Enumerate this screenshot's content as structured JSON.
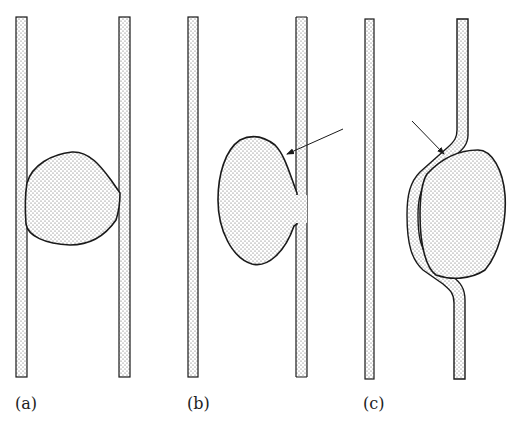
{
  "figure": {
    "panels": [
      {
        "id": "a",
        "label": "(a)"
      },
      {
        "id": "b",
        "label": "(b)"
      },
      {
        "id": "c",
        "label": "(c)"
      }
    ],
    "colors": {
      "stroke": "#1a1a1a",
      "stipple": "#555555",
      "background": "#ffffff"
    }
  }
}
